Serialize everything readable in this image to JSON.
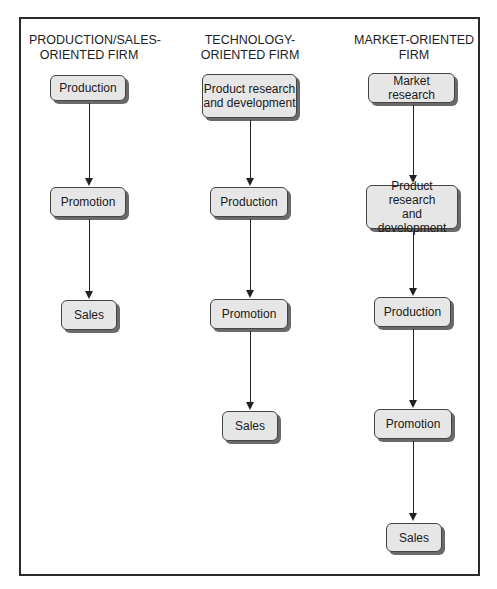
{
  "diagram": {
    "type": "flowchart-comparison",
    "columns": [
      {
        "heading": [
          "PRODUCTION/SALES-",
          "ORIENTED FIRM"
        ],
        "steps": [
          "Production",
          "Promotion",
          "Sales"
        ]
      },
      {
        "heading": [
          "TECHNOLOGY-",
          "ORIENTED FIRM"
        ],
        "steps": [
          "Product research and development",
          "Production",
          "Promotion",
          "Sales"
        ]
      },
      {
        "heading": [
          "MARKET-ORIENTED",
          "FIRM"
        ],
        "steps": [
          "Market research",
          "Product research and development",
          "Production",
          "Promotion",
          "Sales"
        ]
      }
    ],
    "colors": {
      "node_fill": "#e6e6e6",
      "node_border": "#444444",
      "node_shadow": "#6a6a6a",
      "frame_border": "#2b2b2b",
      "arrow": "#222222"
    }
  },
  "labels": {
    "col1_h1": "PRODUCTION/SALES-",
    "col1_h2": "ORIENTED FIRM",
    "col2_h1": "TECHNOLOGY-",
    "col2_h2": "ORIENTED FIRM",
    "col3_h1": "MARKET-ORIENTED",
    "col3_h2": "FIRM",
    "c1_production": "Production",
    "c1_promotion": "Promotion",
    "c1_sales": "Sales",
    "c2_prd_1": "Product research",
    "c2_prd_2": "and development",
    "c2_production": "Production",
    "c2_promotion": "Promotion",
    "c2_sales": "Sales",
    "c3_market_research": "Market research",
    "c3_prd_1": "Product research",
    "c3_prd_2": "and development",
    "c3_production": "Production",
    "c3_promotion": "Promotion",
    "c3_sales": "Sales"
  }
}
